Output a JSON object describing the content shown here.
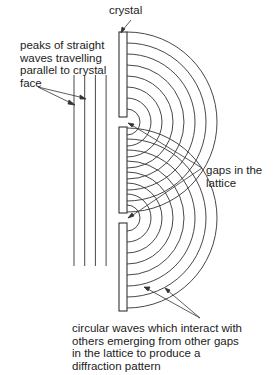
{
  "labels": {
    "crystal": "crystal",
    "straight_waves": [
      "peaks of straight",
      "waves travelling",
      "parallel to crystal",
      "face"
    ],
    "gaps": [
      "gaps in the",
      "lattice"
    ],
    "circular_waves": [
      "circular waves which interact with",
      "others emerging from other gaps",
      "in the lattice to produce a",
      "diffraction pattern"
    ]
  },
  "diagram": {
    "straight_wave_count": 4,
    "crystal_block_count": 3,
    "gap_count": 2,
    "arcs_per_gap": 8,
    "line_color": "#333333"
  }
}
